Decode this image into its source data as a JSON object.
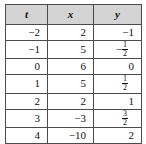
{
  "table": {
    "headers": [
      "t",
      "x",
      "y"
    ],
    "rows": [
      {
        "t": "−2",
        "x": "2",
        "y": "−1",
        "y_type": "int"
      },
      {
        "t": "−1",
        "x": "5",
        "y_type": "neg-frac",
        "y_num": "1",
        "y_den": "2"
      },
      {
        "t": "0",
        "x": "6",
        "y": "0",
        "y_type": "int"
      },
      {
        "t": "1",
        "x": "5",
        "y_type": "frac",
        "y_num": "1",
        "y_den": "2"
      },
      {
        "t": "2",
        "x": "2",
        "y": "1",
        "y_type": "int"
      },
      {
        "t": "3",
        "x": "−3",
        "y_type": "frac",
        "y_num": "3",
        "y_den": "2"
      },
      {
        "t": "4",
        "x": "−10",
        "y": "2",
        "y_type": "int"
      }
    ]
  },
  "style": {
    "header_background": "#d4d4d4",
    "border_color": "#4a4a4a",
    "text_color": "#111111",
    "page_background": "#ffffff"
  }
}
